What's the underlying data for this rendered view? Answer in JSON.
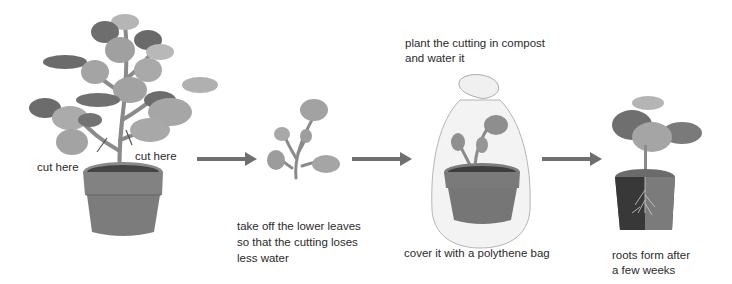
{
  "diagram": {
    "steps": [
      {
        "id": "parent-plant",
        "labels": [
          "cut here",
          "cut here"
        ]
      },
      {
        "id": "cutting",
        "caption": [
          "take off the lower leaves",
          "so that the cutting loses",
          "less water"
        ]
      },
      {
        "id": "bagged-cutting",
        "top_caption": [
          "plant the cutting in compost",
          "and water it"
        ],
        "caption": [
          "cover it with a polythene bag"
        ]
      },
      {
        "id": "rooted-cutting",
        "caption": [
          "roots form after",
          "a few weeks"
        ]
      }
    ],
    "arrows": 3,
    "colors": {
      "leaf_light": "#a8a8a8",
      "leaf_dark": "#6e6e6e",
      "pot": "#7d7d7d",
      "arrow": "#6f6f6f",
      "soil": "#3e3e3e"
    }
  }
}
